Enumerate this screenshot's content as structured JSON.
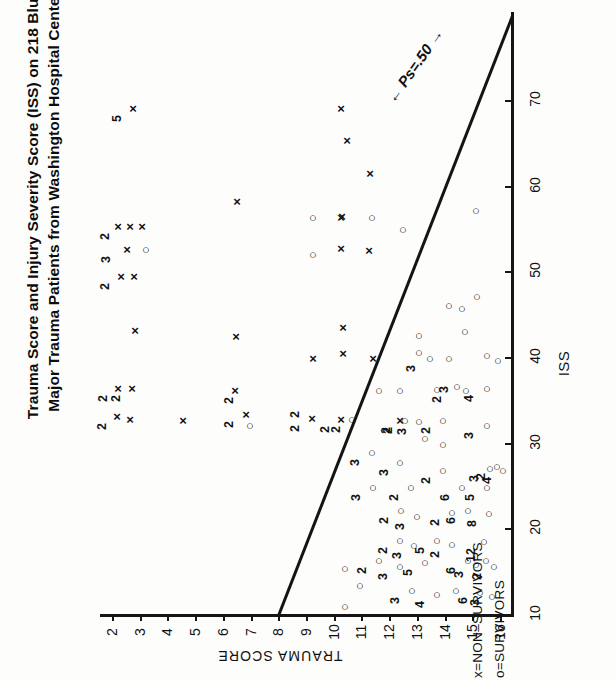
{
  "title": {
    "line1": "Trauma Score and Injury Severity Score (ISS) on 218 Blunt",
    "line2": "Major Trauma Patients from Washington Hospital Center"
  },
  "annotations": {
    "ps_line_label": "Ps=.50"
  },
  "legend": {
    "items": [
      {
        "key": "x",
        "label": "x=NON–SURVIVORS"
      },
      {
        "key": "o",
        "label": "o=SURVIVORS"
      }
    ]
  },
  "axes": {
    "trauma": {
      "title": "TRAUMA SCORE",
      "ticks": [
        "2",
        "3",
        "4",
        "5",
        "6",
        "7",
        "8",
        "9",
        "10",
        "11",
        "12",
        "13",
        "14",
        "15",
        "16"
      ]
    },
    "iss": {
      "title": "ISS",
      "ticks": [
        "10",
        "20",
        "30",
        "40",
        "50",
        "60",
        "70"
      ]
    }
  },
  "chart_data": {
    "type": "scatter",
    "title": "Trauma Score and Injury Severity Score (ISS) on 218 Blunt Major Trauma Patients from Washington Hospital Center",
    "xlabel": "TRAUMA SCORE",
    "ylabel": "ISS",
    "xlim": [
      1.4,
      16.6
    ],
    "ylim": [
      0,
      79
    ],
    "xticks": [
      2,
      3,
      4,
      5,
      6,
      7,
      8,
      9,
      10,
      11,
      12,
      13,
      14,
      15,
      16
    ],
    "yticks": [
      10,
      20,
      30,
      40,
      50,
      60,
      70
    ],
    "grid": false,
    "legend_position": "below-axis-right",
    "total_patients": 218,
    "reference_line": {
      "label": "Ps=.50",
      "note": "diagonal survival-probability isobar with double-headed arrows",
      "endpoints": [
        [
          6.0,
          0
        ],
        [
          16.0,
          79
        ]
      ]
    },
    "series": [
      {
        "name": "x=NON-SURVIVORS",
        "marker": "x",
        "points": [
          {
            "x": 3,
            "y": 76,
            "n": 5
          },
          {
            "x": 10,
            "y": 76,
            "n": 1
          },
          {
            "x": 10,
            "y": 70,
            "n": 1
          },
          {
            "x": 11,
            "y": 66,
            "n": 1
          },
          {
            "x": 7,
            "y": 61,
            "n": 1
          },
          {
            "x": 10,
            "y": 57,
            "n": 1
          },
          {
            "x": 2,
            "y": 53,
            "n": 1
          },
          {
            "x": 2,
            "y": 51,
            "n": 1
          },
          {
            "x": 2,
            "y": 50,
            "n": 2
          },
          {
            "x": 10,
            "y": 50,
            "n": 1
          },
          {
            "x": 11,
            "y": 49,
            "n": 1
          },
          {
            "x": 3,
            "y": 45,
            "n": 3
          },
          {
            "x": 2,
            "y": 43,
            "n": 2
          },
          {
            "x": 10,
            "y": 38,
            "n": 1
          },
          {
            "x": 4,
            "y": 36,
            "n": 1
          },
          {
            "x": 7,
            "y": 36,
            "n": 1
          },
          {
            "x": 9,
            "y": 34,
            "n": 1
          },
          {
            "x": 11,
            "y": 34,
            "n": 1
          },
          {
            "x": 12,
            "y": 34,
            "n": 1
          },
          {
            "x": 2,
            "y": 29,
            "n": 2
          },
          {
            "x": 2,
            "y": 28,
            "n": 2
          },
          {
            "x": 7,
            "y": 28,
            "n": 2
          },
          {
            "x": 2,
            "y": 25,
            "n": 2
          },
          {
            "x": 4,
            "y": 25,
            "n": 1
          },
          {
            "x": 7,
            "y": 25,
            "n": 1
          },
          {
            "x": 10,
            "y": 25,
            "n": 2
          },
          {
            "x": 12,
            "y": 25,
            "n": 1
          },
          {
            "x": 14,
            "y": 25,
            "n": 1
          }
        ]
      },
      {
        "name": "o=SURVIVORS",
        "marker": "o",
        "points": [
          {
            "x": 16,
            "y": 62,
            "n": 1
          },
          {
            "x": 13,
            "y": 59,
            "n": 1
          },
          {
            "x": 9,
            "y": 59,
            "n": 1
          },
          {
            "x": 14,
            "y": 57,
            "n": 1
          },
          {
            "x": 9,
            "y": 45,
            "n": 1
          },
          {
            "x": 3,
            "y": 45,
            "n": 1
          },
          {
            "x": 16,
            "y": 43,
            "n": 1
          },
          {
            "x": 15,
            "y": 41,
            "n": 1
          },
          {
            "x": 15,
            "y": 40,
            "n": 1
          },
          {
            "x": 16,
            "y": 38,
            "n": 1
          },
          {
            "x": 13,
            "y": 36,
            "n": 1
          },
          {
            "x": 13,
            "y": 35,
            "n": 1
          },
          {
            "x": 14,
            "y": 34,
            "n": 3
          },
          {
            "x": 16,
            "y": 34,
            "n": 1
          },
          {
            "x": 16,
            "y": 33,
            "n": 1
          },
          {
            "x": 16,
            "y": 33,
            "n": 1
          },
          {
            "x": 7,
            "y": 24,
            "n": 1
          },
          {
            "x": 10,
            "y": 25,
            "n": 1
          },
          {
            "x": 11,
            "y": 29,
            "n": 1
          },
          {
            "x": 12,
            "y": 29,
            "n": 2
          },
          {
            "x": 14,
            "y": 29,
            "n": 1
          },
          {
            "x": 15,
            "y": 29,
            "n": 2
          },
          {
            "x": 15,
            "y": 29,
            "n": 3
          },
          {
            "x": 16,
            "y": 29,
            "n": 4
          },
          {
            "x": 12,
            "y": 25,
            "n": 2
          },
          {
            "x": 13,
            "y": 25,
            "n": 2
          },
          {
            "x": 14,
            "y": 25,
            "n": 2
          },
          {
            "x": 16,
            "y": 25,
            "n": 3
          },
          {
            "x": 13,
            "y": 22,
            "n": 1
          },
          {
            "x": 14,
            "y": 22,
            "n": 1
          },
          {
            "x": 11,
            "y": 20,
            "n": 1
          },
          {
            "x": 12,
            "y": 19,
            "n": 1
          },
          {
            "x": 14,
            "y": 17,
            "n": 2
          },
          {
            "x": 16,
            "y": 17,
            "n": 3
          },
          {
            "x": 16,
            "y": 17,
            "n": 2
          },
          {
            "x": 16,
            "y": 17,
            "n": 4
          },
          {
            "x": 11,
            "y": 16,
            "n": 3
          },
          {
            "x": 13,
            "y": 16,
            "n": 2
          },
          {
            "x": 15,
            "y": 16,
            "n": 6
          },
          {
            "x": 16,
            "y": 16,
            "n": 5
          },
          {
            "x": 12,
            "y": 13,
            "n": 3
          },
          {
            "x": 13,
            "y": 13,
            "n": 2
          },
          {
            "x": 15,
            "y": 13,
            "n": 2
          },
          {
            "x": 15,
            "y": 13,
            "n": 6
          },
          {
            "x": 16,
            "y": 13,
            "n": 8
          },
          {
            "x": 13,
            "y": 10,
            "n": 2
          },
          {
            "x": 13,
            "y": 10,
            "n": 3
          },
          {
            "x": 14,
            "y": 10,
            "n": 5
          },
          {
            "x": 15,
            "y": 10,
            "n": 2
          },
          {
            "x": 16,
            "y": 10,
            "n": 12
          },
          {
            "x": 12,
            "y": 8,
            "n": 2
          },
          {
            "x": 13,
            "y": 8,
            "n": 3
          },
          {
            "x": 14,
            "y": 8,
            "n": 5
          },
          {
            "x": 16,
            "y": 8,
            "n": 6
          },
          {
            "x": 16,
            "y": 8,
            "n": 3
          },
          {
            "x": 16,
            "y": 8,
            "n": 1
          },
          {
            "x": 16,
            "y": 8,
            "n": 2
          },
          {
            "x": 10,
            "y": 6,
            "n": 1
          },
          {
            "x": 13,
            "y": 5,
            "n": 3
          },
          {
            "x": 14,
            "y": 4,
            "n": 4
          },
          {
            "x": 15,
            "y": 4,
            "n": 1
          },
          {
            "x": 16,
            "y": 4,
            "n": 6
          },
          {
            "x": 16,
            "y": 4,
            "n": 3
          },
          {
            "x": 11,
            "y": 4,
            "n": 1
          },
          {
            "x": 10,
            "y": 2,
            "n": 1
          }
        ]
      }
    ]
  },
  "marks": {
    "x": [
      {
        "px": 133,
        "py": 108
      },
      {
        "px": 341,
        "py": 108
      },
      {
        "px": 347,
        "py": 140
      },
      {
        "px": 370,
        "py": 173
      },
      {
        "px": 237,
        "py": 201
      },
      {
        "px": 342,
        "py": 216
      },
      {
        "px": 118,
        "py": 226
      },
      {
        "px": 130,
        "py": 226
      },
      {
        "px": 142,
        "py": 226
      },
      {
        "px": 341,
        "py": 217
      },
      {
        "px": 341,
        "py": 248
      },
      {
        "px": 369,
        "py": 250
      },
      {
        "px": 127,
        "py": 249
      },
      {
        "px": 121,
        "py": 276
      },
      {
        "px": 134,
        "py": 276
      },
      {
        "px": 343,
        "py": 327
      },
      {
        "px": 135,
        "py": 330
      },
      {
        "px": 236,
        "py": 336
      },
      {
        "px": 313,
        "py": 358
      },
      {
        "px": 343,
        "py": 353
      },
      {
        "px": 373,
        "py": 358
      },
      {
        "px": 118,
        "py": 388
      },
      {
        "px": 132,
        "py": 388
      },
      {
        "px": 235,
        "py": 390
      },
      {
        "px": 117,
        "py": 416
      },
      {
        "px": 130,
        "py": 419
      },
      {
        "px": 183,
        "py": 420
      },
      {
        "px": 246,
        "py": 414
      },
      {
        "px": 312,
        "py": 418
      },
      {
        "px": 341,
        "py": 419
      },
      {
        "px": 400,
        "py": 420
      }
    ],
    "o": [
      {
        "px": 476,
        "py": 210
      },
      {
        "px": 372,
        "py": 217
      },
      {
        "px": 313,
        "py": 217
      },
      {
        "px": 403,
        "py": 229
      },
      {
        "px": 313,
        "py": 254
      },
      {
        "px": 146,
        "py": 249
      },
      {
        "px": 477,
        "py": 296
      },
      {
        "px": 449,
        "py": 305
      },
      {
        "px": 462,
        "py": 308
      },
      {
        "px": 465,
        "py": 331
      },
      {
        "px": 419,
        "py": 335
      },
      {
        "px": 419,
        "py": 352
      },
      {
        "px": 449,
        "py": 358
      },
      {
        "px": 430,
        "py": 358
      },
      {
        "px": 487,
        "py": 355
      },
      {
        "px": 498,
        "py": 360
      },
      {
        "px": 250,
        "py": 425
      },
      {
        "px": 352,
        "py": 419
      },
      {
        "px": 379,
        "py": 390
      },
      {
        "px": 400,
        "py": 390
      },
      {
        "px": 437,
        "py": 389
      },
      {
        "px": 457,
        "py": 386
      },
      {
        "px": 466,
        "py": 390
      },
      {
        "px": 487,
        "py": 388
      },
      {
        "px": 405,
        "py": 420
      },
      {
        "px": 419,
        "py": 421
      },
      {
        "px": 443,
        "py": 420
      },
      {
        "px": 487,
        "py": 425
      },
      {
        "px": 425,
        "py": 438
      },
      {
        "px": 443,
        "py": 444
      },
      {
        "px": 372,
        "py": 452
      },
      {
        "px": 400,
        "py": 462
      },
      {
        "px": 443,
        "py": 470
      },
      {
        "px": 490,
        "py": 468
      },
      {
        "px": 497,
        "py": 466
      },
      {
        "px": 503,
        "py": 470
      },
      {
        "px": 373,
        "py": 487
      },
      {
        "px": 411,
        "py": 487
      },
      {
        "px": 462,
        "py": 487
      },
      {
        "px": 487,
        "py": 487
      },
      {
        "px": 401,
        "py": 510
      },
      {
        "px": 417,
        "py": 516
      },
      {
        "px": 452,
        "py": 512
      },
      {
        "px": 468,
        "py": 510
      },
      {
        "px": 489,
        "py": 513
      },
      {
        "px": 400,
        "py": 540
      },
      {
        "px": 414,
        "py": 545
      },
      {
        "px": 437,
        "py": 540
      },
      {
        "px": 452,
        "py": 544
      },
      {
        "px": 484,
        "py": 541
      },
      {
        "px": 379,
        "py": 560
      },
      {
        "px": 400,
        "py": 566
      },
      {
        "px": 425,
        "py": 562
      },
      {
        "px": 468,
        "py": 560
      },
      {
        "px": 476,
        "py": 564
      },
      {
        "px": 486,
        "py": 560
      },
      {
        "px": 494,
        "py": 566
      },
      {
        "px": 345,
        "py": 568
      },
      {
        "px": 412,
        "py": 590
      },
      {
        "px": 437,
        "py": 594
      },
      {
        "px": 456,
        "py": 590
      },
      {
        "px": 480,
        "py": 592
      },
      {
        "px": 492,
        "py": 596
      },
      {
        "px": 360,
        "py": 585
      },
      {
        "px": 345,
        "py": 606
      }
    ],
    "counts": [
      {
        "px": 121,
        "py": 108,
        "t": "5"
      },
      {
        "px": 109,
        "py": 226,
        "t": "2"
      },
      {
        "px": 110,
        "py": 249,
        "t": "3"
      },
      {
        "px": 109,
        "py": 276,
        "t": "2"
      },
      {
        "px": 107,
        "py": 388,
        "t": "2"
      },
      {
        "px": 120,
        "py": 388,
        "t": "2"
      },
      {
        "px": 106,
        "py": 416,
        "t": "2"
      },
      {
        "px": 233,
        "py": 414,
        "t": "2"
      },
      {
        "px": 233,
        "py": 390,
        "t": "2"
      },
      {
        "px": 299,
        "py": 418,
        "t": "2"
      },
      {
        "px": 299,
        "py": 404,
        "t": "2"
      },
      {
        "px": 329,
        "py": 419,
        "t": "2"
      },
      {
        "px": 390,
        "py": 420,
        "t": "2"
      },
      {
        "px": 340,
        "py": 419,
        "t": "2"
      },
      {
        "px": 415,
        "py": 358,
        "t": "3"
      },
      {
        "px": 441,
        "py": 389,
        "t": "2"
      },
      {
        "px": 448,
        "py": 379,
        "t": "3"
      },
      {
        "px": 473,
        "py": 388,
        "t": "4"
      },
      {
        "px": 392,
        "py": 420,
        "t": "2"
      },
      {
        "px": 406,
        "py": 421,
        "t": "3"
      },
      {
        "px": 430,
        "py": 420,
        "t": "2"
      },
      {
        "px": 473,
        "py": 425,
        "t": "3"
      },
      {
        "px": 359,
        "py": 452,
        "t": "3"
      },
      {
        "px": 388,
        "py": 462,
        "t": "3"
      },
      {
        "px": 430,
        "py": 470,
        "t": "2"
      },
      {
        "px": 478,
        "py": 468,
        "t": "3"
      },
      {
        "px": 485,
        "py": 466,
        "t": "2"
      },
      {
        "px": 491,
        "py": 470,
        "t": "4"
      },
      {
        "px": 360,
        "py": 487,
        "t": "3"
      },
      {
        "px": 398,
        "py": 487,
        "t": "2"
      },
      {
        "px": 449,
        "py": 487,
        "t": "6"
      },
      {
        "px": 474,
        "py": 487,
        "t": "5"
      },
      {
        "px": 388,
        "py": 510,
        "t": "2"
      },
      {
        "px": 404,
        "py": 516,
        "t": "3"
      },
      {
        "px": 439,
        "py": 512,
        "t": "2"
      },
      {
        "px": 455,
        "py": 510,
        "t": "6"
      },
      {
        "px": 476,
        "py": 513,
        "t": "8"
      },
      {
        "px": 387,
        "py": 540,
        "t": "2"
      },
      {
        "px": 401,
        "py": 545,
        "t": "3"
      },
      {
        "px": 424,
        "py": 540,
        "t": "5"
      },
      {
        "px": 439,
        "py": 544,
        "t": "2"
      },
      {
        "px": 471,
        "py": 541,
        "t": "12"
      },
      {
        "px": 366,
        "py": 560,
        "t": "2"
      },
      {
        "px": 387,
        "py": 566,
        "t": "3"
      },
      {
        "px": 412,
        "py": 562,
        "t": "5"
      },
      {
        "px": 455,
        "py": 560,
        "t": "6"
      },
      {
        "px": 463,
        "py": 564,
        "t": "3"
      },
      {
        "px": 481,
        "py": 566,
        "t": "2"
      },
      {
        "px": 399,
        "py": 590,
        "t": "3"
      },
      {
        "px": 424,
        "py": 594,
        "t": "4"
      },
      {
        "px": 467,
        "py": 590,
        "t": "6"
      },
      {
        "px": 479,
        "py": 592,
        "t": "3"
      }
    ]
  }
}
